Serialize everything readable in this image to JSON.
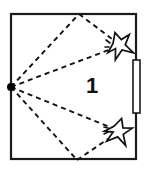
{
  "figure": {
    "type": "room-reflection-diagram",
    "width": 146,
    "height": 171,
    "background_color": "#ffffff",
    "line_color": "#1a1a1a",
    "label": "1"
  },
  "room": {
    "name": "room-outline",
    "shape": "rectangle",
    "x": 10,
    "y": 13,
    "width": 127,
    "height": 147,
    "stroke_color": "#1a1a1a",
    "stroke_width": 2,
    "fill_color": "#ffffff"
  },
  "source": {
    "name": "sound-source-point",
    "x": 11,
    "y": 87,
    "radius": 4,
    "color": "#000000"
  },
  "door": {
    "name": "door-opening",
    "x": 133,
    "y": 60,
    "width": 7,
    "height": 53,
    "fill_color": "#ffffff",
    "stroke_color": "#1a1a1a"
  },
  "receivers": [
    {
      "name": "receiver-burst-upper",
      "cx": 119,
      "cy": 45,
      "size": 13,
      "rotation": -18
    },
    {
      "name": "receiver-burst-lower",
      "cx": 118,
      "cy": 131,
      "size": 13,
      "rotation": 16
    }
  ],
  "reflection_points": [
    {
      "name": "reflection-point-top",
      "x": 79,
      "y": 14,
      "wall": "top"
    },
    {
      "name": "reflection-point-bottom",
      "x": 77,
      "y": 160,
      "wall": "bottom"
    }
  ],
  "paths": [
    {
      "name": "path-direct-upper",
      "from": [
        11,
        87
      ],
      "to": [
        114,
        48
      ],
      "style": "dashed"
    },
    {
      "name": "path-reflect-up-incident",
      "from": [
        11,
        87
      ],
      "to": [
        79,
        14
      ],
      "style": "dashed"
    },
    {
      "name": "path-reflect-up-reflected",
      "from": [
        79,
        14
      ],
      "to": [
        116,
        42
      ],
      "style": "dashed"
    },
    {
      "name": "path-direct-lower",
      "from": [
        11,
        87
      ],
      "to": [
        112,
        128
      ],
      "style": "dashed"
    },
    {
      "name": "path-reflect-down-incident",
      "from": [
        11,
        87
      ],
      "to": [
        77,
        160
      ],
      "style": "dashed"
    },
    {
      "name": "path-reflect-down-reflected",
      "from": [
        77,
        160
      ],
      "to": [
        114,
        135
      ],
      "style": "dashed"
    }
  ],
  "dash_pattern": "5 4",
  "room_label": {
    "name": "room-number-label",
    "text": "1",
    "x": 92,
    "y": 87
  }
}
